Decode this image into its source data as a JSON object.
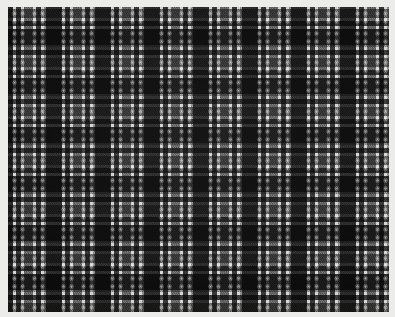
{
  "image": {
    "subject": "tartan-plaid-woven-fabric-swatch",
    "description": "Grayscale tartan / plaid woven textile swatch photographed flat on a light background",
    "width_px": 395,
    "height_px": 317,
    "color_mode": "grayscale",
    "mount_color": "#ececeb",
    "margins_px": {
      "left": 8,
      "top": 7,
      "right": 6,
      "bottom": 5
    }
  },
  "weave": {
    "structure": "twill",
    "texture": "fine diagonal twill with visible checkerboard yarn interlace",
    "yarn_scale_px": 2,
    "symmetric_sett": true
  },
  "sett": {
    "repeat_width_px": 49,
    "repeat_height_px": 49,
    "repeats_across": 8,
    "repeats_down": 6.4,
    "palette": {
      "black": "#2b2b2b",
      "charcoal": "#3a3a3a",
      "dark_gray": "#474747",
      "mid_gray": "#6e6e6e",
      "light_gray": "#9a9a9a",
      "white": "#e9e9e9",
      "bright_white": "#f4f4f4"
    },
    "threadcount": [
      {
        "color": "black",
        "hex": "#2b2b2b",
        "threads": 16
      },
      {
        "color": "white",
        "hex": "#e9e9e9",
        "threads": 3
      },
      {
        "color": "charcoal",
        "hex": "#3a3a3a",
        "threads": 5
      },
      {
        "color": "white",
        "hex": "#e9e9e9",
        "threads": 3
      },
      {
        "color": "mid_gray",
        "hex": "#6e6e6e",
        "threads": 9
      },
      {
        "color": "white",
        "hex": "#e9e9e9",
        "threads": 3
      },
      {
        "color": "charcoal",
        "hex": "#3a3a3a",
        "threads": 5
      },
      {
        "color": "white",
        "hex": "#e9e9e9",
        "threads": 3
      },
      {
        "color": "light_gray",
        "hex": "#9a9a9a",
        "threads": 2
      }
    ]
  },
  "layers": {
    "warp_label": "vertical warp stripes",
    "weft_label": "horizontal weft stripes",
    "cross_label": "crossing highlight nodes",
    "twill_label": "diagonal twill texture",
    "checker_label": "yarn interlace checker",
    "grain_label": "yarn grain irregularity",
    "vignette_label": "scan lighting vignette"
  }
}
